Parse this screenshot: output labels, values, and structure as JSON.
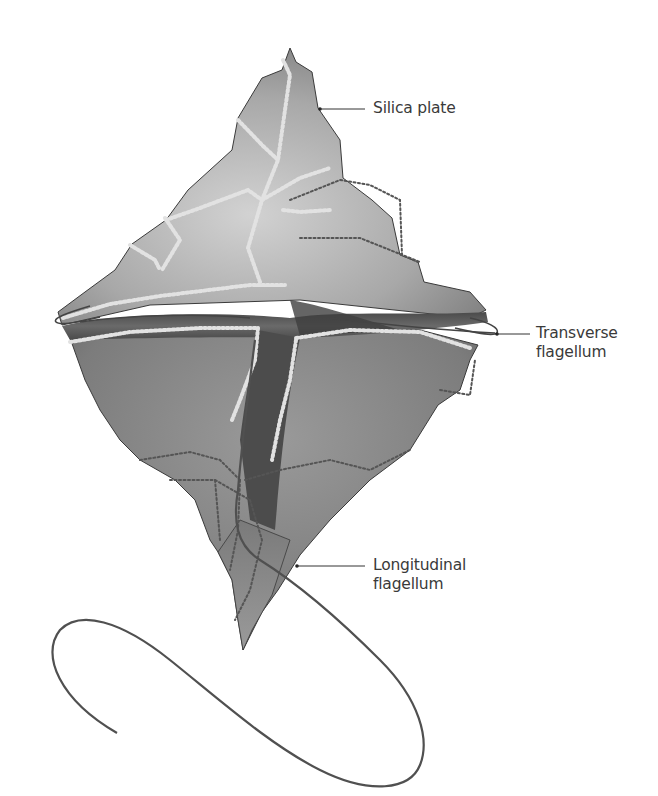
{
  "figure": {
    "colors": {
      "background": "#ffffff",
      "body_light": "#b9b9b9",
      "body_mid": "#8c8c8c",
      "body_dark": "#555555",
      "suture_beads": "#d8d8d8",
      "flagellum": "#4a4a4a",
      "label_text": "#3a3a3a"
    }
  },
  "labels": [
    {
      "id": "silica-plate",
      "lines": [
        "Silica plate"
      ]
    },
    {
      "id": "transverse-flagellum",
      "lines": [
        "Transverse",
        "flagellum"
      ]
    },
    {
      "id": "longitudinal-flagellum",
      "lines": [
        "Longitudinal",
        "flagellum"
      ]
    }
  ]
}
